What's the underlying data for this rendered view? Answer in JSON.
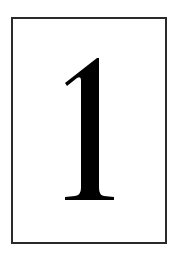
{
  "card": {
    "label": "1",
    "border_color": "#2a2a2a",
    "digit_color": "#000000",
    "background": "#ffffff"
  }
}
